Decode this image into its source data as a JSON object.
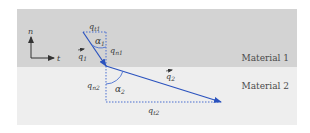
{
  "materials": [
    {
      "label": "Material 1",
      "color": "#d3d3d3"
    },
    {
      "label": "Material 2",
      "color": "#eeeeee"
    }
  ],
  "axes": {
    "n_label": "n",
    "t_label": "t"
  },
  "vectors": {
    "q1": {
      "label": "q",
      "sub": "1",
      "color": "#2a52be"
    },
    "q2": {
      "label": "q",
      "sub": "2",
      "color": "#2a52be"
    }
  },
  "components": {
    "qt1": {
      "label": "q",
      "sub": "t1"
    },
    "qn1": {
      "label": "q",
      "sub": "n1"
    },
    "qn2": {
      "label": "q",
      "sub": "n2"
    },
    "qt2": {
      "label": "q",
      "sub": "t2"
    }
  },
  "angles": {
    "alpha1": {
      "label": "α",
      "sub": "1"
    },
    "alpha2": {
      "label": "α",
      "sub": "2"
    }
  },
  "colors": {
    "vector": "#2a52be",
    "dotted": "#4a6fd0",
    "axis": "#333333"
  }
}
